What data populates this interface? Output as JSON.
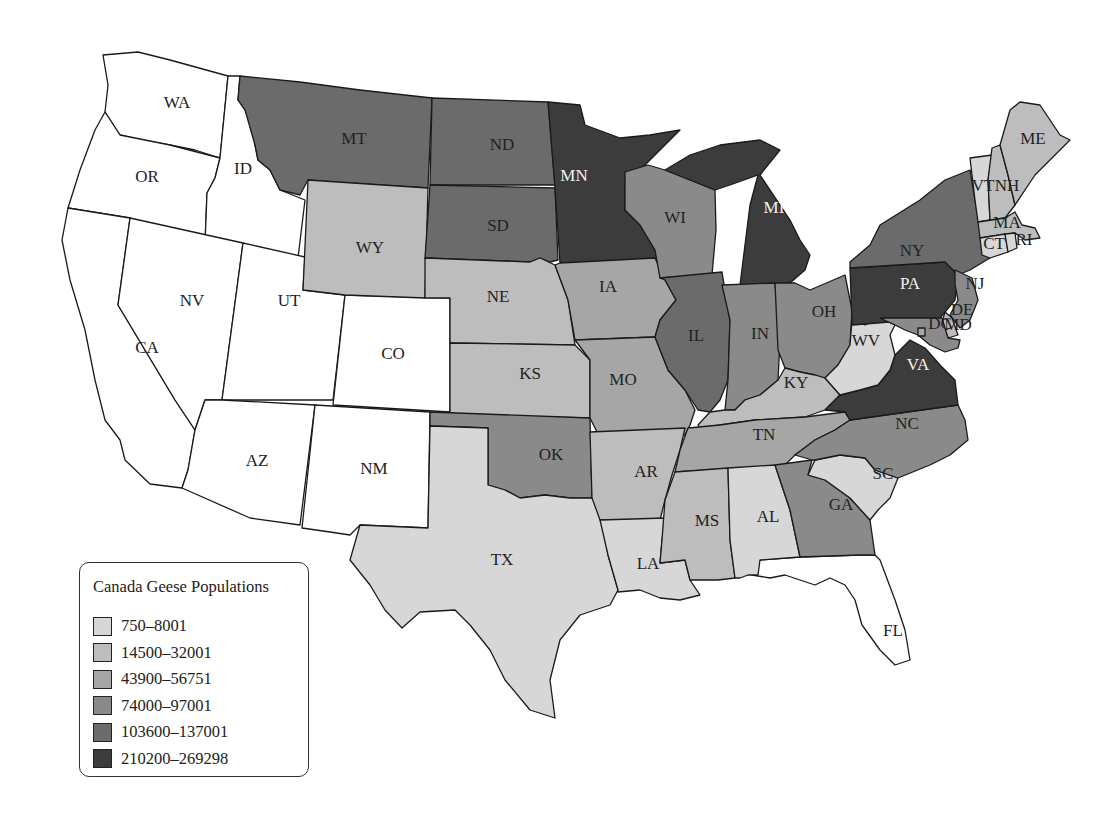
{
  "legend": {
    "title": "Canada Geese Populations",
    "items": [
      {
        "label": "750–8001",
        "color": "#d7d7d7"
      },
      {
        "label": "14500–32001",
        "color": "#bdbdbd"
      },
      {
        "label": "43900–56751",
        "color": "#a6a6a6"
      },
      {
        "label": "74000–97001",
        "color": "#8a8a8a"
      },
      {
        "label": "103600–137001",
        "color": "#6b6b6b"
      },
      {
        "label": "210200–269298",
        "color": "#3c3c3c"
      }
    ]
  },
  "no_data_color": "#ffffff",
  "states": {
    "WA": {
      "label": "WA",
      "class": null
    },
    "OR": {
      "label": "OR",
      "class": null
    },
    "CA": {
      "label": "CA",
      "class": null
    },
    "ID": {
      "label": "ID",
      "class": null
    },
    "NV": {
      "label": "NV",
      "class": null
    },
    "UT": {
      "label": "UT",
      "class": null
    },
    "AZ": {
      "label": "AZ",
      "class": null
    },
    "CO": {
      "label": "CO",
      "class": null
    },
    "NM": {
      "label": "NM",
      "class": null
    },
    "FL": {
      "label": "FL",
      "class": null
    },
    "MT": {
      "label": "MT",
      "class": 4
    },
    "WY": {
      "label": "WY",
      "class": 1
    },
    "ND": {
      "label": "ND",
      "class": 4
    },
    "SD": {
      "label": "SD",
      "class": 4
    },
    "NE": {
      "label": "NE",
      "class": 1
    },
    "KS": {
      "label": "KS",
      "class": 1
    },
    "OK": {
      "label": "OK",
      "class": 3
    },
    "TX": {
      "label": "TX",
      "class": 0
    },
    "MN": {
      "label": "MN",
      "class": 5
    },
    "IA": {
      "label": "IA",
      "class": 2
    },
    "MO": {
      "label": "MO",
      "class": 2
    },
    "AR": {
      "label": "AR",
      "class": 1
    },
    "LA": {
      "label": "LA",
      "class": 0
    },
    "WI": {
      "label": "WI",
      "class": 3
    },
    "IL": {
      "label": "IL",
      "class": 4
    },
    "MI": {
      "label": "MI",
      "class": 5
    },
    "IN": {
      "label": "IN",
      "class": 3
    },
    "OH": {
      "label": "OH",
      "class": 3
    },
    "KY": {
      "label": "KY",
      "class": 1
    },
    "TN": {
      "label": "TN",
      "class": 2
    },
    "MS": {
      "label": "MS",
      "class": 1
    },
    "AL": {
      "label": "AL",
      "class": 0
    },
    "GA": {
      "label": "GA",
      "class": 3
    },
    "SC": {
      "label": "SC",
      "class": 0
    },
    "NC": {
      "label": "NC",
      "class": 3
    },
    "VA": {
      "label": "VA",
      "class": 5
    },
    "WV": {
      "label": "WV",
      "class": 0
    },
    "PA": {
      "label": "PA",
      "class": 5
    },
    "NY": {
      "label": "NY",
      "class": 4
    },
    "NJ": {
      "label": "NJ",
      "class": 3
    },
    "DE": {
      "label": "DE",
      "class": 1
    },
    "MD": {
      "label": "MD",
      "class": 3
    },
    "DC": {
      "label": "DC",
      "class": 2
    },
    "VT": {
      "label": "VT",
      "class": 0
    },
    "NH": {
      "label": "NH",
      "class": 1
    },
    "ME": {
      "label": "ME",
      "class": 1
    },
    "MA": {
      "label": "MA",
      "class": 1
    },
    "CT": {
      "label": "CT",
      "class": 0
    },
    "RI": {
      "label": "RI",
      "class": 0
    }
  }
}
